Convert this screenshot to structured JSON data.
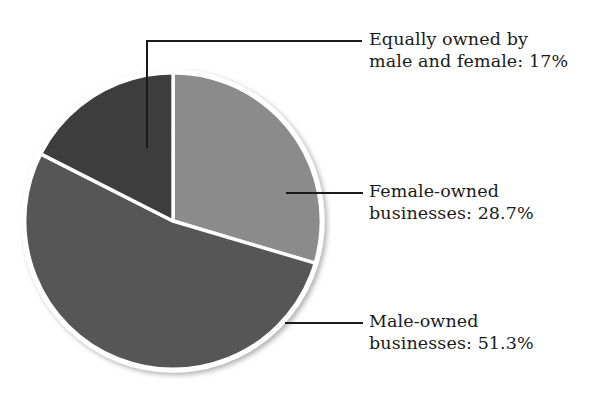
{
  "chart_data": {
    "type": "pie",
    "title": "",
    "subtitle": "",
    "xlabel": "",
    "ylabel": "",
    "legend_position": "callout-labels-right",
    "grid": false,
    "start_angle_deg": 0,
    "direction": "clockwise",
    "categories": [
      "Female-owned businesses",
      "Male-owned businesses",
      "Equally owned by male and female"
    ],
    "values": [
      28.7,
      51.3,
      17
    ],
    "value_unit": "%",
    "colors": [
      "#8b8b8b",
      "#565656",
      "#3c3c3c"
    ],
    "separator_color": "#ffffff",
    "slices": [
      {
        "name": "female-owned",
        "category": "Female-owned businesses",
        "value": 28.7,
        "value_label": "28.7%",
        "color": "#8b8b8b",
        "start_angle_deg": 0,
        "end_angle_deg": 103.32
      },
      {
        "name": "male-owned",
        "category": "Male-owned businesses",
        "value": 51.3,
        "value_label": "51.3%",
        "color": "#565656",
        "start_angle_deg": 103.32,
        "end_angle_deg": 288.0
      },
      {
        "name": "equally-owned",
        "category": "Equally owned by male and female",
        "value": 17,
        "value_label": "17%",
        "color": "#3c3c3c",
        "start_angle_deg": 288.0,
        "end_angle_deg": 360.0
      }
    ]
  },
  "labels": {
    "equally_owned": {
      "line1": "Equally owned by",
      "line2": "male and female: 17%"
    },
    "female_owned": {
      "line1": "Female-owned",
      "line2": "businesses: 28.7%"
    },
    "male_owned": {
      "line1": "Male-owned",
      "line2": "businesses: 51.3%"
    }
  }
}
